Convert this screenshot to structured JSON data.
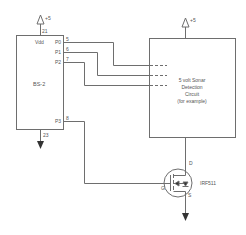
{
  "diagram": {
    "bs2": {
      "label": "BS-2",
      "vdd_label": "Vdd",
      "power_label": "+5",
      "power_pin": "21",
      "ground_pin": "23",
      "pins": [
        {
          "name": "P0",
          "number": "5"
        },
        {
          "name": "P1",
          "number": "6"
        },
        {
          "name": "P2",
          "number": "7"
        },
        {
          "name": "P3",
          "number": "8"
        }
      ]
    },
    "sonar": {
      "power_label": "+5",
      "lines": [
        "5 volt Sonar",
        "Detection",
        "Circuit",
        "(for example)"
      ]
    },
    "mosfet": {
      "part": "IRF511",
      "drain": "D",
      "gate": "G",
      "source": "S"
    },
    "colors": {
      "line": "#6e6e6e",
      "text": "#555555",
      "arrow": "#333333"
    }
  }
}
